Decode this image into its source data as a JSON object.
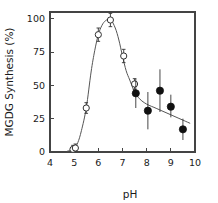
{
  "chart_data": {
    "type": "scatter",
    "title": "",
    "xlabel": "pH",
    "ylabel": "MGDG Synthesis (%)",
    "xlim": [
      4,
      10
    ],
    "ylim": [
      0,
      105
    ],
    "xticks": [
      4,
      5,
      6,
      7,
      8,
      9,
      10
    ],
    "xtick_labels": [
      "4",
      "5",
      "6",
      "7",
      "8",
      "9",
      "10"
    ],
    "yticks": [
      0,
      25,
      50,
      75,
      100
    ],
    "ytick_labels": [
      "0",
      "25",
      "50",
      "75",
      "100"
    ],
    "grid": false,
    "legend": "none",
    "frame": "box",
    "series": [
      {
        "name": "open-circles",
        "marker": "open-circle",
        "color": "#333333",
        "points": [
          {
            "x": 4.95,
            "y": 2,
            "yerr_low": 2,
            "yerr_high": 3
          },
          {
            "x": 5.05,
            "y": 3,
            "yerr_low": 2,
            "yerr_high": 3
          },
          {
            "x": 5.5,
            "y": 33,
            "yerr_low": 4,
            "yerr_high": 4
          },
          {
            "x": 6.0,
            "y": 88,
            "yerr_low": 5,
            "yerr_high": 5
          },
          {
            "x": 6.5,
            "y": 99,
            "yerr_low": 5,
            "yerr_high": 5
          },
          {
            "x": 7.05,
            "y": 72,
            "yerr_low": 5,
            "yerr_high": 5
          },
          {
            "x": 7.5,
            "y": 51,
            "yerr_low": 4,
            "yerr_high": 4
          }
        ]
      },
      {
        "name": "filled-circles",
        "marker": "filled-circle",
        "color": "#111111",
        "points": [
          {
            "x": 7.55,
            "y": 44,
            "yerr_low": 11,
            "yerr_high": 11
          },
          {
            "x": 8.05,
            "y": 31,
            "yerr_low": 14,
            "yerr_high": 14
          },
          {
            "x": 8.55,
            "y": 46,
            "yerr_low": 16,
            "yerr_high": 16
          },
          {
            "x": 9.0,
            "y": 34,
            "yerr_low": 8,
            "yerr_high": 9
          },
          {
            "x": 9.5,
            "y": 17,
            "yerr_low": 8,
            "yerr_high": 8
          }
        ]
      }
    ],
    "fit_curve": {
      "name": "pH-response-curve",
      "color": "#555555",
      "x": [
        4.7,
        4.85,
        5.0,
        5.15,
        5.3,
        5.5,
        5.7,
        5.85,
        6.0,
        6.15,
        6.3,
        6.5,
        6.7,
        6.85,
        7.0,
        7.15,
        7.3,
        7.5,
        7.7,
        7.9,
        8.1,
        8.3,
        8.55,
        8.8,
        9.05,
        9.3,
        9.55,
        9.8
      ],
      "y": [
        0.5,
        1.5,
        3.0,
        7.0,
        16.0,
        33.0,
        60.0,
        76.0,
        88.0,
        95.0,
        98.5,
        99.5,
        93.0,
        84.0,
        72.0,
        61.0,
        54.0,
        45.0,
        40.0,
        37.0,
        35.0,
        33.5,
        31.5,
        29.5,
        27.5,
        25.5,
        23.5,
        21.5
      ]
    }
  }
}
